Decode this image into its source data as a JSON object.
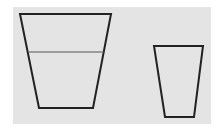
{
  "diagram": {
    "background_color": "#e4e4e4",
    "stroke_color": "#222222",
    "fill_line_color": "#555555",
    "cups": [
      {
        "name": "large-cup",
        "points": "20,14 111,14 93,108 39,108",
        "fill_line": {
          "x1": 28,
          "y1": 52,
          "x2": 104,
          "y2": 52
        }
      },
      {
        "name": "small-cup",
        "points": "154,46 203,46 194,117 165,117"
      }
    ]
  }
}
